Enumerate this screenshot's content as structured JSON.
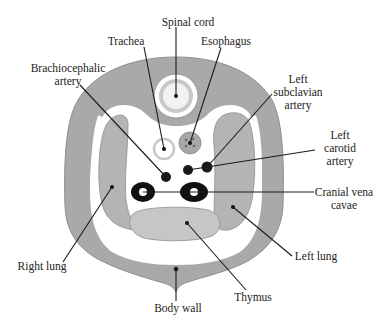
{
  "diagram": {
    "colors": {
      "body_wall": "#a9a9a9",
      "body_wall_edge": "#8e8e8e",
      "lung": "#b4b4b4",
      "thymus": "#c6c6c6",
      "cavity": "#ffffff",
      "vessel": "#111111",
      "label_text": "#222222"
    },
    "labels": {
      "spinal_cord": "Spinal cord",
      "trachea": "Trachea",
      "esophagus": "Esophagus",
      "brachiocephalic_line1": "Brachiocephalic",
      "brachiocephalic_line2": "artery",
      "left_subclavian_line1": "Left",
      "left_subclavian_line2": "subclavian",
      "left_subclavian_line3": "artery",
      "left_carotid_line1": "Left",
      "left_carotid_line2": "carotid",
      "left_carotid_line3": "artery",
      "cranial_vena_line1": "Cranial vena",
      "cranial_vena_line2": "cavae",
      "right_lung": "Right lung",
      "left_lung": "Left lung",
      "body_wall": "Body wall",
      "thymus": "Thymus"
    }
  }
}
